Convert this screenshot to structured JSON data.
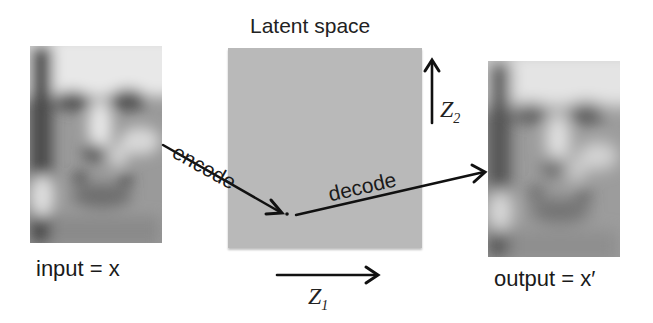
{
  "diagram": {
    "title": "Latent space",
    "input": {
      "label": "input = x"
    },
    "output": {
      "label": "output = x′"
    },
    "axes": {
      "z1": {
        "symbol": "Z",
        "subscript": "1"
      },
      "z2": {
        "symbol": "Z",
        "subscript": "2"
      }
    },
    "arrows": {
      "encode": "encode",
      "decode": "decode"
    },
    "colors": {
      "latent_fill": "#b9b9b9",
      "arrow": "#111111",
      "text": "#1a1a1a"
    }
  }
}
